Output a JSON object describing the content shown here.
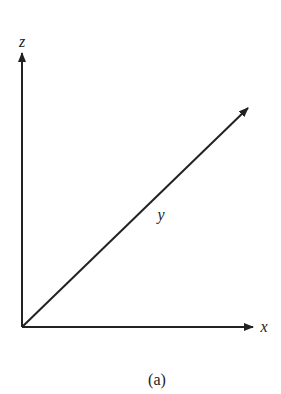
{
  "diagram": {
    "type": "3d-coordinate-axes",
    "axes": [
      {
        "name": "z",
        "label": "z",
        "direction": "up"
      },
      {
        "name": "x",
        "label": "x",
        "direction": "right"
      },
      {
        "name": "y",
        "label": "y",
        "direction": "diagonal-up-right"
      }
    ],
    "caption": "(a)",
    "colors": {
      "line": "#222222",
      "background": "#ffffff"
    }
  }
}
